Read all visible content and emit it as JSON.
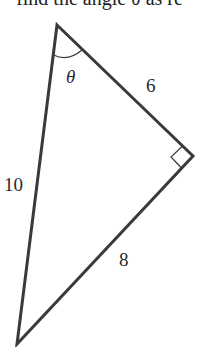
{
  "caption": "find the angle θ as re",
  "figure": {
    "type": "right-triangle",
    "labels": {
      "angle": "θ",
      "side_top_right": "6",
      "side_left": "10",
      "side_bottom_right": "8"
    },
    "vertices": {
      "top": [
        57,
        25
      ],
      "right": [
        193,
        156
      ],
      "bottom": [
        17,
        344
      ]
    },
    "right_angle_at": "right",
    "stroke_color": "#3a3a3a"
  }
}
